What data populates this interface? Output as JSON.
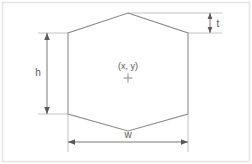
{
  "diagram": {
    "shape": "hexagon",
    "colors": {
      "background": "#ffffff",
      "panel_border": "#e6e6e6",
      "shape_stroke": "#8c8c8c",
      "extension_line": "#bdbdbd",
      "dimension_line": "#6b6b6b",
      "text": "#58585a"
    },
    "center_marker": {
      "label": "(x, y)",
      "marker_glyph": "crosshair-plus",
      "x": 128,
      "y": 78
    },
    "dimensions": [
      {
        "id": "h",
        "label": "h",
        "orientation": "vertical",
        "meaning": "height of the vertical side span",
        "line_x": 47,
        "from_y": 33,
        "to_y": 114,
        "label_x": 38,
        "label_y": 76
      },
      {
        "id": "w",
        "label": "w",
        "orientation": "horizontal",
        "meaning": "width across the flat sides",
        "line_y": 142,
        "from_x": 68,
        "to_x": 188,
        "label_x": 128,
        "label_y": 137
      },
      {
        "id": "t",
        "label": "t",
        "orientation": "vertical",
        "meaning": "height of the top point above the side",
        "line_x": 210,
        "from_y": 13,
        "to_y": 33,
        "label_x": 218,
        "label_y": 27
      }
    ],
    "vertices": [
      {
        "name": "top",
        "x": 128,
        "y": 13
      },
      {
        "name": "upper-right",
        "x": 188,
        "y": 33
      },
      {
        "name": "lower-right",
        "x": 188,
        "y": 114
      },
      {
        "name": "bottom",
        "x": 128,
        "y": 131
      },
      {
        "name": "lower-left",
        "x": 68,
        "y": 114
      },
      {
        "name": "upper-left",
        "x": 68,
        "y": 33
      }
    ]
  }
}
